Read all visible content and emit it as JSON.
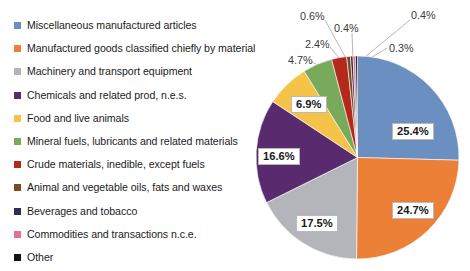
{
  "chart_data": {
    "type": "pie",
    "title": "",
    "start_angle_deg": 0,
    "direction": "clockwise",
    "legend_position": "left",
    "grid": false,
    "value_unit": "percent",
    "categories": [
      "Miscellaneous manufactured articles",
      "Manufactured goods classified chiefly by material",
      "Machinery and transport equipment",
      "Chemicals and related prod, n.e.s.",
      "Food and live animals",
      "Mineral fuels, lubricants and related materials",
      "Crude materials, inedible, except fuels",
      "Animal and vegetable oils, fats and waxes",
      "Beverages and tobacco",
      "Commodities and transactions n.c.e.",
      "Other"
    ],
    "values": [
      25.4,
      24.7,
      17.5,
      16.6,
      6.9,
      4.7,
      2.4,
      0.6,
      0.4,
      0.4,
      0.3
    ],
    "labels": [
      "25.4%",
      "24.7%",
      "17.5%",
      "16.6%",
      "6.9%",
      "4.7%",
      "2.4%",
      "0.6%",
      "0.4%",
      "0.4%",
      "0.3%"
    ],
    "colors": [
      "#6b8fc1",
      "#ed8037",
      "#b3b5bb",
      "#5a2a6e",
      "#f7c council",
      "#79a95b",
      "#b5281c",
      "#7b4a1e",
      "#2b2f55",
      "#e8708f",
      "#151515"
    ]
  },
  "legend": {
    "items": [
      {
        "label": "Miscellaneous manufactured articles",
        "color": "#6b8fc1"
      },
      {
        "label": "Manufactured goods classified chiefly by material",
        "color": "#ed8037"
      },
      {
        "label": "Machinery and transport equipment",
        "color": "#b3b5bb"
      },
      {
        "label": "Chemicals and related prod, n.e.s.",
        "color": "#5a2a6e"
      },
      {
        "label": "Food and live animals",
        "color": "#f6c349"
      },
      {
        "label": "Mineral fuels, lubricants and related materials",
        "color": "#79a95b"
      },
      {
        "label": "Crude materials, inedible, except fuels",
        "color": "#b5281c"
      },
      {
        "label": "Animal and vegetable oils, fats and waxes",
        "color": "#7b4a1e"
      },
      {
        "label": "Beverages and tobacco",
        "color": "#2b2f55"
      },
      {
        "label": "Commodities and transactions n.c.e.",
        "color": "#e8708f"
      },
      {
        "label": "Other",
        "color": "#151515"
      }
    ]
  },
  "pie_labels": {
    "inner": [
      {
        "text": "25.4%",
        "left": 392,
        "top": 123
      },
      {
        "text": "24.7%",
        "left": 392,
        "top": 202
      },
      {
        "text": "17.5%",
        "left": 296,
        "top": 215
      },
      {
        "text": "16.6%",
        "left": 258,
        "top": 148
      },
      {
        "text": "6.9%",
        "left": 291,
        "top": 96
      }
    ],
    "outer": [
      {
        "text": "4.7%",
        "left": 288,
        "top": 54
      },
      {
        "text": "2.4%",
        "left": 305,
        "top": 38
      },
      {
        "text": "0.6%",
        "left": 300,
        "top": 10
      },
      {
        "text": "0.4%",
        "left": 334,
        "top": 22
      },
      {
        "text": "0.4%",
        "left": 411,
        "top": 9
      },
      {
        "text": "0.3%",
        "left": 389,
        "top": 42
      }
    ]
  }
}
